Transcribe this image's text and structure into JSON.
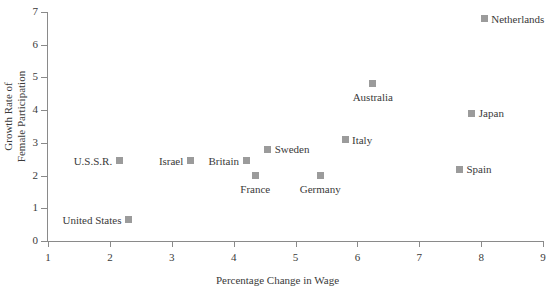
{
  "chart_data": {
    "type": "scatter",
    "title": "",
    "xlabel": "Percentage Change in Wage",
    "ylabel": "Growth Rate of\nFemale Participation",
    "xlim": [
      1,
      9
    ],
    "ylim": [
      0,
      7
    ],
    "xticks": [
      1,
      2,
      3,
      4,
      5,
      6,
      7,
      8,
      9
    ],
    "yticks": [
      0,
      1,
      2,
      3,
      4,
      5,
      6,
      7
    ],
    "grid": false,
    "legend": "none",
    "marker_color": "#9b9b9b",
    "axis_color": "#8a8a8a",
    "points": [
      {
        "label": "Netherlands",
        "x": 8.05,
        "y": 6.8,
        "label_pos": "right"
      },
      {
        "label": "Japan",
        "x": 7.85,
        "y": 3.9,
        "label_pos": "right"
      },
      {
        "label": "Spain",
        "x": 7.65,
        "y": 2.2,
        "label_pos": "right"
      },
      {
        "label": "Australia",
        "x": 6.25,
        "y": 4.8,
        "label_pos": "below"
      },
      {
        "label": "Italy",
        "x": 5.8,
        "y": 3.1,
        "label_pos": "right"
      },
      {
        "label": "Germany",
        "x": 5.4,
        "y": 2.0,
        "label_pos": "below"
      },
      {
        "label": "Sweden",
        "x": 4.55,
        "y": 2.8,
        "label_pos": "right"
      },
      {
        "label": "France",
        "x": 4.35,
        "y": 2.0,
        "label_pos": "below"
      },
      {
        "label": "Britain",
        "x": 4.2,
        "y": 2.45,
        "label_pos": "left"
      },
      {
        "label": "Israel",
        "x": 3.3,
        "y": 2.45,
        "label_pos": "left"
      },
      {
        "label": "U.S.S.R.",
        "x": 2.15,
        "y": 2.45,
        "label_pos": "left"
      },
      {
        "label": "United States",
        "x": 2.3,
        "y": 0.65,
        "label_pos": "left"
      }
    ]
  }
}
